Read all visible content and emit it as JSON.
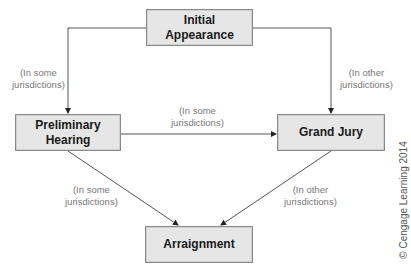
{
  "diagram": {
    "nodes": {
      "initial": {
        "line1": "Initial",
        "line2": "Appearance"
      },
      "preliminary": {
        "line1": "Preliminary",
        "line2": "Hearing"
      },
      "grand_jury": {
        "label": "Grand Jury"
      },
      "arraignment": {
        "label": "Arraignment"
      }
    },
    "edges": [
      {
        "from": "Initial Appearance",
        "to": "Preliminary Hearing",
        "line1": "(In some",
        "line2": "jurisdictions)"
      },
      {
        "from": "Initial Appearance",
        "to": "Grand Jury",
        "line1": "(In other",
        "line2": "jurisdictions)"
      },
      {
        "from": "Preliminary Hearing",
        "to": "Grand Jury",
        "line1": "(In some",
        "line2": "jurisdictions)"
      },
      {
        "from": "Preliminary Hearing",
        "to": "Arraignment",
        "line1": "(In some",
        "line2": "jurisdictions)"
      },
      {
        "from": "Grand Jury",
        "to": "Arraignment",
        "line1": "(In other",
        "line2": "jurisdictions)"
      }
    ],
    "credit": "© Cengage Learning 2014"
  }
}
